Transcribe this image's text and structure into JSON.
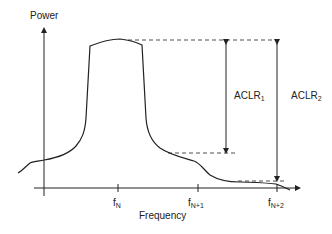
{
  "diagram": {
    "y_axis_label": "Power",
    "x_axis_label": "Frequency",
    "ticks": [
      {
        "base": "f",
        "sub": "N"
      },
      {
        "base": "f",
        "sub": "N+1"
      },
      {
        "base": "f",
        "sub": "N+2"
      }
    ],
    "annotations": [
      {
        "base": "ACLR",
        "sub": "1"
      },
      {
        "base": "ACLR",
        "sub": "2"
      }
    ],
    "colors": {
      "line": "#222222",
      "background": "#ffffff"
    }
  }
}
